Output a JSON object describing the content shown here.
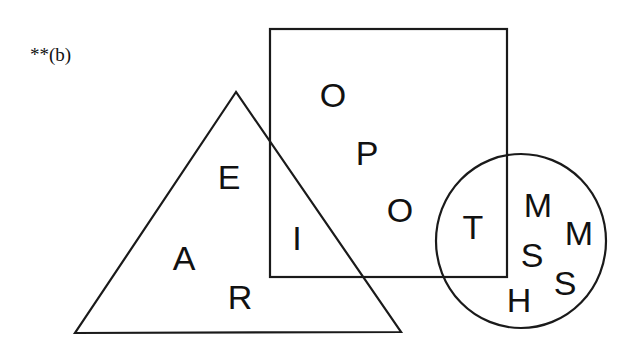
{
  "figure": {
    "label": "**(b)",
    "colors": {
      "stroke": "#1a1a1a",
      "text": "#111111",
      "background": "#ffffff"
    }
  },
  "shapes": {
    "square": {
      "x": 270,
      "y": 29,
      "width": 237,
      "height": 248
    },
    "triangle": {
      "points": "236,92 75,333 401,332"
    },
    "circle": {
      "cx": 521,
      "cy": 241,
      "rx": 85,
      "ry": 87
    }
  },
  "letters": {
    "square_only": [
      "O",
      "P",
      "O"
    ],
    "triangle_only": [
      "E",
      "A",
      "R"
    ],
    "triangle_and_square": [
      "I"
    ],
    "square_and_circle": [
      "T"
    ],
    "circle_only": [
      "M",
      "M",
      "S",
      "S",
      "H"
    ]
  },
  "letter_items": [
    {
      "char": "O",
      "region": "square",
      "x": 333,
      "y": 107
    },
    {
      "char": "P",
      "region": "square",
      "x": 367,
      "y": 165
    },
    {
      "char": "O",
      "region": "square",
      "x": 400,
      "y": 222
    },
    {
      "char": "E",
      "region": "triangle",
      "x": 229,
      "y": 189
    },
    {
      "char": "I",
      "region": "triangle-square",
      "x": 297,
      "y": 250
    },
    {
      "char": "A",
      "region": "triangle",
      "x": 184,
      "y": 270
    },
    {
      "char": "R",
      "region": "triangle",
      "x": 240,
      "y": 309
    },
    {
      "char": "T",
      "region": "square-circle",
      "x": 473,
      "y": 239
    },
    {
      "char": "M",
      "region": "circle",
      "x": 538,
      "y": 217
    },
    {
      "char": "M",
      "region": "circle",
      "x": 579,
      "y": 245
    },
    {
      "char": "S",
      "region": "circle",
      "x": 532,
      "y": 267
    },
    {
      "char": "S",
      "region": "circle",
      "x": 565,
      "y": 295
    },
    {
      "char": "H",
      "region": "circle",
      "x": 519,
      "y": 312
    }
  ]
}
